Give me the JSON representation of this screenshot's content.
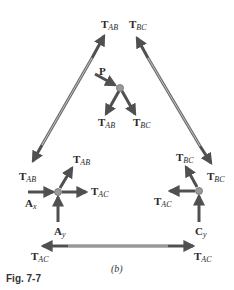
{
  "figure": {
    "label": "Fig. 7-7",
    "caption": "(b)"
  },
  "labels": {
    "top_tab": {
      "main": "T",
      "sub": "AB"
    },
    "top_tbc": {
      "main": "T",
      "sub": "BC"
    },
    "p": {
      "main": "P",
      "sub": ""
    },
    "b_tab": {
      "main": "T",
      "sub": "AB"
    },
    "b_tbc": {
      "main": "T",
      "sub": "BC"
    },
    "left_member_tab": {
      "main": "T",
      "sub": "AB"
    },
    "a_tab": {
      "main": "T",
      "sub": "AB"
    },
    "a_tac": {
      "main": "T",
      "sub": "AC"
    },
    "ax": {
      "main": "A",
      "sub": "x"
    },
    "ay": {
      "main": "A",
      "sub": "y"
    },
    "c_tbc": {
      "main": "T",
      "sub": "BC"
    },
    "right_member_tbc": {
      "main": "T",
      "sub": "BC"
    },
    "c_tac": {
      "main": "T",
      "sub": "AC"
    },
    "cy": {
      "main": "C",
      "sub": "y"
    },
    "bottom_left_tac": {
      "main": "T",
      "sub": "AC"
    },
    "bottom_right_tac": {
      "main": "T",
      "sub": "AC"
    }
  },
  "colors": {
    "arrow": "#505050",
    "member_outer": "#6a6a6a",
    "member_inner": "#b8b8b8",
    "joint": "#9a9a9a"
  }
}
